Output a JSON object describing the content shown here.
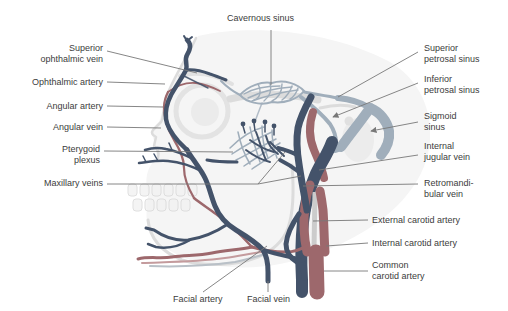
{
  "figure": {
    "kind": "anatomical-diagram",
    "colors": {
      "vein": "#44536a",
      "artery": "#9d686c",
      "artery_light": "#c49b9d",
      "sinus": "#a0aebb",
      "bone": "#dcdcdc",
      "bone_fill": "#f5f5f5",
      "leader": "#787878",
      "text": "#3c3c3c",
      "background": "#ffffff"
    },
    "labels": {
      "cavernous_sinus": "Cavernous sinus",
      "superior_ophthalmic_vein": "Superior\nophthalmic vein",
      "ophthalmic_artery": "Ophthalmic artery",
      "angular_artery": "Angular artery",
      "angular_vein": "Angular vein",
      "pterygoid_plexus": "Pterygoid\nplexus",
      "maxillary_veins": "Maxillary veins",
      "superior_petrosal_sinus": "Superior\npetrosal sinus",
      "inferior_petrosal_sinus": "Inferior\npetrosal sinus",
      "sigmoid_sinus": "Sigmoid\nsinus",
      "internal_jugular_vein": "Internal\njugular vein",
      "retromandibular_vein": "Retromandi-\nbular vein",
      "external_carotid_artery": "External carotid artery",
      "internal_carotid_artery": "Internal carotid artery",
      "common_carotid_artery": "Common\ncarotid artery",
      "facial_artery": "Facial artery",
      "facial_vein": "Facial vein"
    }
  }
}
